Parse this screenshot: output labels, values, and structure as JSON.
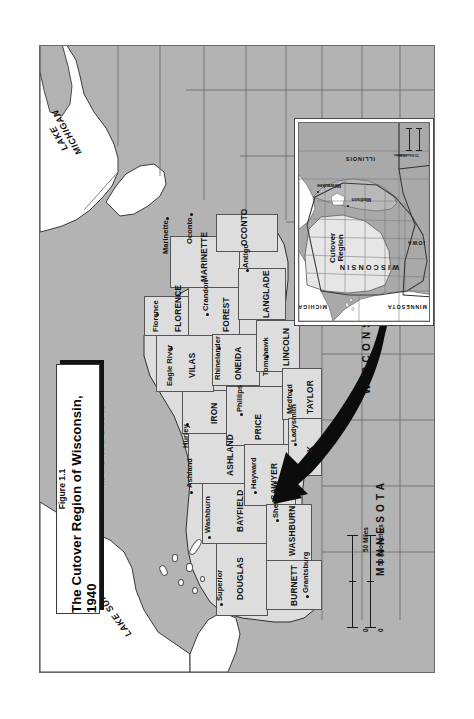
{
  "figure": {
    "number": "Figure 1.1",
    "title": "The Cutover Region of Wisconsin, 1940"
  },
  "water_labels": [
    {
      "name": "lake-superior-label",
      "text": "LAKE SUPERIOR"
    },
    {
      "name": "lake-michigan-label",
      "line1": "LAKE",
      "line2": "MICHIGAN"
    }
  ],
  "state_labels": [
    {
      "name": "michigan-label",
      "text": "MICHIGAN"
    },
    {
      "name": "wisconsin-label",
      "text": "WISCONSIN"
    },
    {
      "name": "minnesota-label",
      "text": "MINNESOTA"
    }
  ],
  "counties": [
    {
      "name": "douglas",
      "label": "DOUGLAS",
      "city": "Superior"
    },
    {
      "name": "bayfield",
      "label": "BAYFIELD",
      "city": "Washburn"
    },
    {
      "name": "ashland",
      "label": "ASHLAND",
      "city": "Ashland"
    },
    {
      "name": "iron",
      "label": "IRON",
      "city": "Hurley"
    },
    {
      "name": "vilas",
      "label": "VILAS",
      "city": "Eagle River"
    },
    {
      "name": "florence",
      "label": "FLORENCE",
      "city": "Florence"
    },
    {
      "name": "forest",
      "label": "FOREST",
      "city": "Crandon"
    },
    {
      "name": "marinette",
      "label": "MARINETTE",
      "city": "Marinette"
    },
    {
      "name": "oconto",
      "label": "OCONTO",
      "city": "Oconto"
    },
    {
      "name": "langlade",
      "label": "LANGLADE",
      "city": "Antigo"
    },
    {
      "name": "oneida",
      "label": "ONEIDA",
      "city": "Rhinelander"
    },
    {
      "name": "lincoln",
      "label": "LINCOLN",
      "city": "Tomahawk"
    },
    {
      "name": "price",
      "label": "PRICE",
      "city": "Phillips"
    },
    {
      "name": "taylor",
      "label": "TAYLOR",
      "city": "Medford"
    },
    {
      "name": "sawyer",
      "label": "SAWYER",
      "city": "Hayward"
    },
    {
      "name": "washburn",
      "label": "WASHBURN",
      "city": "Shell Lake"
    },
    {
      "name": "burnett",
      "label": "BURNETT",
      "city": "Grantsburg"
    },
    {
      "name": "rusk",
      "label": "RUSK",
      "city": "Ladysmith"
    }
  ],
  "scale": {
    "miles_label": "50 Miles",
    "kilometers_label": "50 Kilometers",
    "zero_miles": "0",
    "zero_kilometers": "0"
  },
  "inset": {
    "region_label_line1": "Cutover",
    "region_label_line2": "Region",
    "states": [
      {
        "name": "inset-wisconsin",
        "text": "WISCONSIN"
      },
      {
        "name": "inset-michigan",
        "text": "MICHIGAN"
      },
      {
        "name": "inset-minnesota",
        "text": "MINNESOTA"
      },
      {
        "name": "inset-iowa",
        "text": "IOWA"
      },
      {
        "name": "inset-illinois",
        "text": "ILLINOIS"
      }
    ],
    "cities": [
      {
        "name": "inset-milwaukee",
        "text": "Milwaukee"
      },
      {
        "name": "inset-madison",
        "text": "Madison"
      }
    ],
    "scale": {
      "miles_label": "75 Miles",
      "kilometers_label": "75 Kilometers"
    }
  },
  "colors": {
    "cutover_fill": "#ddddde",
    "other_fill": "#b2b2b3",
    "water_fill": "#ffffff",
    "ink": "#111111"
  }
}
